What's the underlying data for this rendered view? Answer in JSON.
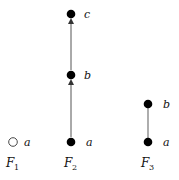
{
  "diagram": {
    "frames": [
      {
        "label": "F",
        "subscript": "1",
        "nodes": [
          {
            "id": "a",
            "label": "a",
            "filled": false
          }
        ],
        "edges": []
      },
      {
        "label": "F",
        "subscript": "2",
        "nodes": [
          {
            "id": "a",
            "label": "a",
            "filled": true
          },
          {
            "id": "b",
            "label": "b",
            "filled": true
          },
          {
            "id": "c",
            "label": "c",
            "filled": true
          }
        ],
        "edges": [
          {
            "from": "a",
            "to": "b",
            "directed": true
          },
          {
            "from": "b",
            "to": "c",
            "directed": true
          }
        ]
      },
      {
        "label": "F",
        "subscript": "3",
        "nodes": [
          {
            "id": "a",
            "label": "a",
            "filled": true
          },
          {
            "id": "b",
            "label": "b",
            "filled": true
          }
        ],
        "edges": [
          {
            "from": "a",
            "to": "b",
            "directed": false
          }
        ]
      }
    ]
  }
}
